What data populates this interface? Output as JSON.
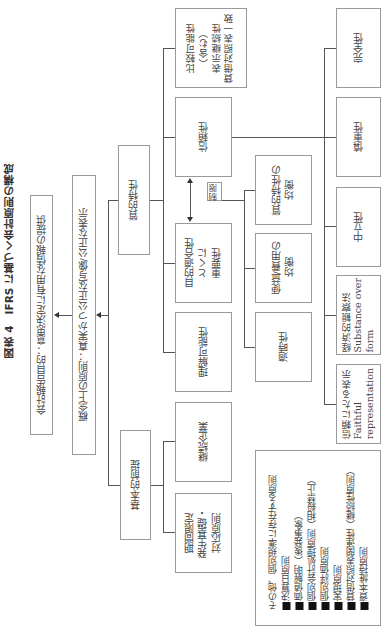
{
  "title": "図表 4　IFRS に基づく会計原則の構成",
  "top_boxes": {
    "objective": "会計報告目的：意思決定に有用な情報の提供",
    "concept": "概念上の原則：真実かつ公正な写像/公正な表示"
  },
  "level2": {
    "qualitative": "質的特性",
    "assumptions": "基本的前提"
  },
  "level3": {
    "comparability": [
      "比較可能性",
      "（含む）",
      "表示継続性",
      "貸借対照表一致"
    ],
    "reliability": "信頼性",
    "relevance": [
      "目的適合性",
      "とくに",
      "重要性"
    ],
    "understandability": "理解可能性",
    "going_concern": "継続企業",
    "accrual": [
      "期間限定",
      "発生基礎・",
      "対応原則"
    ]
  },
  "constraint_label": "制限",
  "constraints": {
    "balance": [
      "質的特性の",
      "均衡"
    ],
    "cost_benefit": [
      "便益/費用の",
      "均衡"
    ],
    "timeliness": "適時性"
  },
  "reliability_components": {
    "completeness": "完全性",
    "prudence": "慎重性",
    "neutrality": "中立性",
    "substance": [
      "経済的観察法",
      "Substance over",
      "form"
    ],
    "faithful": [
      "信頼にたる表示",
      "Faithful",
      "representation"
    ]
  },
  "other_principles": {
    "heading": "その他、個別規準に存在する原則",
    "items": [
      "決算日原則",
      "価値解明（後発事象）",
      "個別会計処理原則（相殺禁止）",
      "個別評価原則",
      "実現原則",
      "貸借対照表関連性（継続性原則）",
      "資本維持原則"
    ]
  }
}
